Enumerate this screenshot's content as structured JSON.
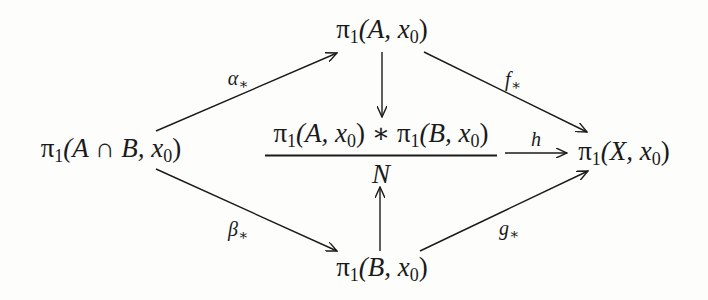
{
  "diagram": {
    "type": "commutative-diagram",
    "nodes": {
      "top": {
        "pre": "π",
        "sub": "1",
        "args": "(A, x",
        "argsub": "0",
        "close": ")"
      },
      "left": {
        "pre": "π",
        "sub": "1",
        "args": "(A ∩ B, x",
        "argsub": "0",
        "close": ")"
      },
      "right": {
        "pre": "π",
        "sub": "1",
        "args": "(X, x",
        "argsub": "0",
        "close": ")"
      },
      "bottom": {
        "pre": "π",
        "sub": "1",
        "args": "(B, x",
        "argsub": "0",
        "close": ")"
      },
      "center": {
        "numerator_a": {
          "pre": "π",
          "sub": "1",
          "args": "(A, x",
          "argsub": "0",
          "close": ")"
        },
        "op": " ∗ ",
        "numerator_b": {
          "pre": "π",
          "sub": "1",
          "args": "(B, x",
          "argsub": "0",
          "close": ")"
        },
        "denominator": "N"
      }
    },
    "arrows": {
      "alpha": {
        "from": "left",
        "to": "top",
        "label": "α",
        "label_sub": "∗"
      },
      "f": {
        "from": "top",
        "to": "right",
        "label": "f",
        "label_sub": "∗"
      },
      "beta": {
        "from": "left",
        "to": "bottom",
        "label": "β",
        "label_sub": "∗"
      },
      "g": {
        "from": "bottom",
        "to": "right",
        "label": "g",
        "label_sub": "∗"
      },
      "h": {
        "from": "center",
        "to": "right",
        "label": "h"
      },
      "top_down": {
        "from": "top",
        "to": "center",
        "label": ""
      },
      "bottom_up": {
        "from": "bottom",
        "to": "center",
        "label": ""
      }
    }
  }
}
